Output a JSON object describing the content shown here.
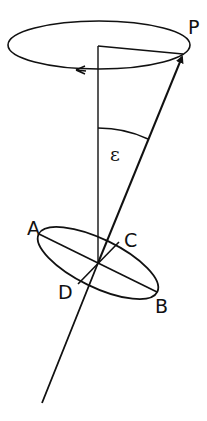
{
  "diagram": {
    "labels": {
      "P": "P",
      "epsilon": "ε",
      "A": "A",
      "B": "B",
      "C": "C",
      "D": "D"
    },
    "colors": {
      "stroke": "#111111",
      "background": "#ffffff"
    }
  }
}
